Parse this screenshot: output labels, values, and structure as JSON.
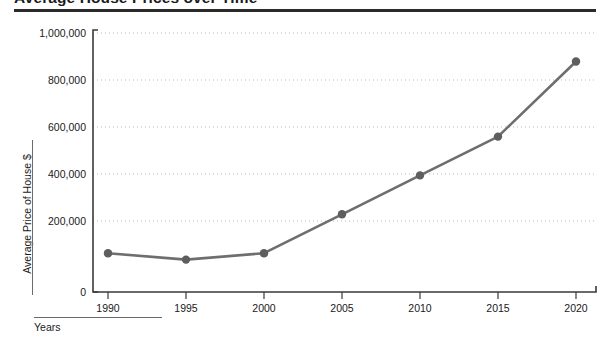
{
  "title": {
    "text": "Average House Prices over Time",
    "visible_note": "cropped at top edge"
  },
  "axis_captions": {
    "y": "Average Price of House  $",
    "x": "Years"
  },
  "chart_data": {
    "type": "line",
    "title": "Average House Prices over Time",
    "xlabel": "Years",
    "ylabel": "Average Price of House  $",
    "x": [
      1990,
      1995,
      2000,
      2005,
      2010,
      2015,
      2020
    ],
    "categories": [
      "1990",
      "1995",
      "2000",
      "2005",
      "2010",
      "2015",
      "2020"
    ],
    "values": [
      150000,
      125000,
      150000,
      300000,
      450000,
      600000,
      890000
    ],
    "series": [
      {
        "name": "Average Price of House",
        "values": [
          150000,
          125000,
          150000,
          300000,
          450000,
          600000,
          890000
        ]
      }
    ],
    "xlim": [
      1990,
      2020
    ],
    "ylim": [
      0,
      1000000
    ],
    "ytick_labels": [
      "0",
      "200,000",
      "400,000",
      "600,000",
      "800,000",
      "1,000,000"
    ],
    "ytick_values": [
      0,
      200000,
      400000,
      600000,
      800000,
      1000000
    ],
    "xtick_labels": [
      "1990",
      "1995",
      "2000",
      "2005",
      "2010",
      "2015",
      "2020"
    ],
    "grid": "horizontal-dotted",
    "legend": "none",
    "marker": "circle",
    "colors": {
      "line": "#6e6e6e",
      "marker": "#5e5e5e",
      "grid": "#b9b9b9",
      "axis": "#3a3a3a",
      "title_rule": "#2b2b2b",
      "text": "#1a1a1a",
      "background": "#ffffff"
    }
  }
}
